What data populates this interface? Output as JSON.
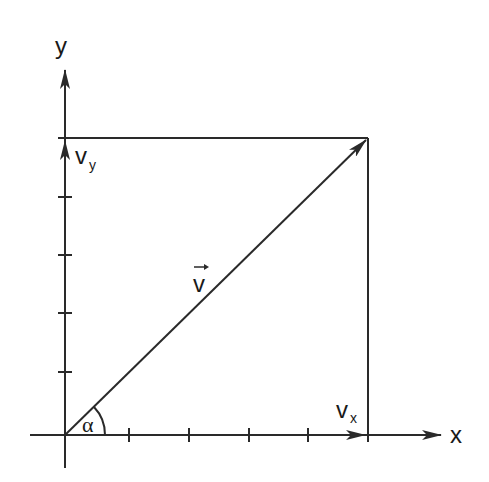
{
  "diagram": {
    "type": "vector-decomposition",
    "axes": {
      "x_label": "x",
      "y_label": "y",
      "origin": [
        65,
        435
      ],
      "x_ticks_px": [
        129,
        189,
        249,
        308
      ],
      "y_ticks_px": [
        197,
        255,
        313,
        372
      ]
    },
    "vector": {
      "label": "v",
      "has_arrow_accent": true,
      "tip": [
        368,
        138
      ]
    },
    "components": {
      "vx_label": "v",
      "vx_subscript": "x",
      "vy_label": "v",
      "vy_subscript": "y"
    },
    "angle": {
      "label": "α"
    },
    "colors": {
      "line": "#2a2a2a",
      "background": "#ffffff"
    }
  }
}
